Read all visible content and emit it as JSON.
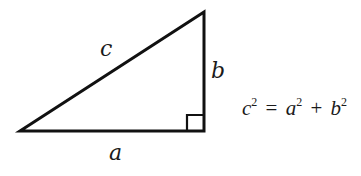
{
  "diagram": {
    "stroke_color": "#111111",
    "vertices": {
      "left": [
        20,
        131
      ],
      "right_angle": [
        204,
        131
      ],
      "top": [
        204,
        12
      ]
    },
    "right_angle_marker_size": 17,
    "labels": {
      "hypotenuse": "c",
      "vertical_leg": "b",
      "horizontal_leg": "a"
    },
    "equation": {
      "lhs_var": "c",
      "lhs_exp": "2",
      "equals": "=",
      "term1_var": "a",
      "term1_exp": "2",
      "plus": "+",
      "term2_var": "b",
      "term2_exp": "2"
    }
  }
}
